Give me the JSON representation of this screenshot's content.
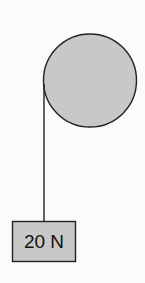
{
  "diagram": {
    "type": "pulley-with-hanging-mass",
    "pulley": {
      "shape": "circle",
      "fill": "#c8c8c8",
      "stroke": "#222222"
    },
    "rope": {
      "stroke": "#222222"
    },
    "mass": {
      "label": "20 N",
      "fill": "#c8c8c8",
      "stroke": "#222222"
    }
  }
}
